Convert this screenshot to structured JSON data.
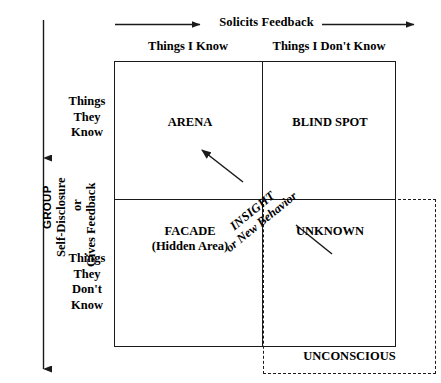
{
  "diagram": {
    "top_axis": {
      "label": "Solicits Feedback",
      "arrow_name": "solicits-feedback-arrow"
    },
    "left_axis": {
      "group_label": "GROUP",
      "self_disclosure_label": "Self-Disclosure",
      "or_label": "or",
      "gives_feedback_label": "Gives Feedback",
      "arrow_name": "self-disclosure-arrow"
    },
    "column_headers": [
      "Things I Know",
      "Things I Don't Know"
    ],
    "row_headers": [
      "Things\nThey\nKnow",
      "Things\nThey\nDon't\nKnow"
    ],
    "row_header_top_line1": "Things",
    "row_header_top_line2": "They",
    "row_header_top_line3": "Know",
    "row_header_bottom_line1": "Things",
    "row_header_bottom_line2": "They",
    "row_header_bottom_line3": "Don't",
    "row_header_bottom_line4": "Know",
    "quadrants": [
      {
        "id": "arena",
        "label": "ARENA",
        "sublabel": ""
      },
      {
        "id": "blind",
        "label": "BLIND SPOT",
        "sublabel": ""
      },
      {
        "id": "facade",
        "label": "FACADE",
        "sublabel": "(Hidden Area)"
      },
      {
        "id": "unknown",
        "label": "UNKNOWN",
        "sublabel": ""
      }
    ],
    "insight_arrow": {
      "line1": "INSIGHT",
      "line2": "or New Behavior"
    },
    "unconscious": {
      "label": "UNCONSCIOUS"
    },
    "colors": {
      "line": "#1a1a1a",
      "text": "#000000",
      "background": "#ffffff"
    }
  }
}
